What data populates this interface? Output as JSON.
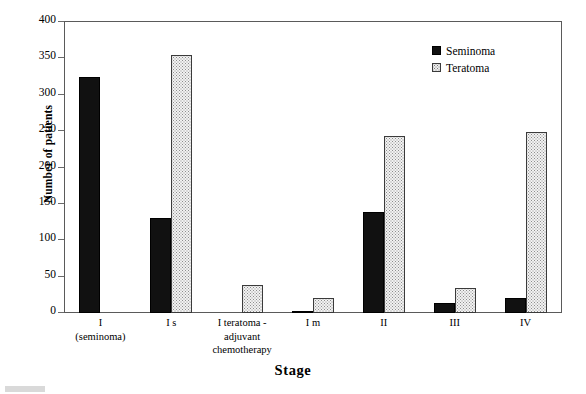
{
  "chart_data": {
    "type": "bar",
    "title": "",
    "xlabel": "Stage",
    "ylabel": "Number of patients",
    "ylim": [
      0,
      400
    ],
    "yticks": [
      0,
      50,
      100,
      150,
      200,
      250,
      300,
      350,
      400
    ],
    "grid": false,
    "legend_position": "top-right",
    "categories": [
      "I\n(seminoma)",
      "I s",
      "I teratoma -\nadjuvant\nchemotherapy",
      "I m",
      "II",
      "III",
      "IV"
    ],
    "category_lines": [
      [
        "I",
        "(seminoma)"
      ],
      [
        "I s"
      ],
      [
        "I teratoma -",
        "adjuvant",
        "chemotherapy"
      ],
      [
        "I m"
      ],
      [
        "II"
      ],
      [
        "III"
      ],
      [
        "IV"
      ]
    ],
    "series": [
      {
        "name": "Seminoma",
        "color": "#111111",
        "pattern": "solid",
        "values": [
          325,
          130,
          0,
          2,
          139,
          14,
          20
        ]
      },
      {
        "name": "Teratoma",
        "color": "#f2f2f2",
        "pattern": "dotted",
        "values": [
          0,
          355,
          38,
          20,
          244,
          34,
          249
        ]
      }
    ]
  },
  "axis": {
    "y_title": "Number of patients",
    "x_title": "Stage",
    "y_tick_labels": [
      "400",
      "350",
      "300",
      "250",
      "200",
      "150",
      "100",
      "50",
      "0"
    ]
  },
  "legend": {
    "items": [
      {
        "label": "Seminoma",
        "swatch": "solid-black-square"
      },
      {
        "label": "Teratoma",
        "swatch": "dotted-square"
      }
    ]
  }
}
